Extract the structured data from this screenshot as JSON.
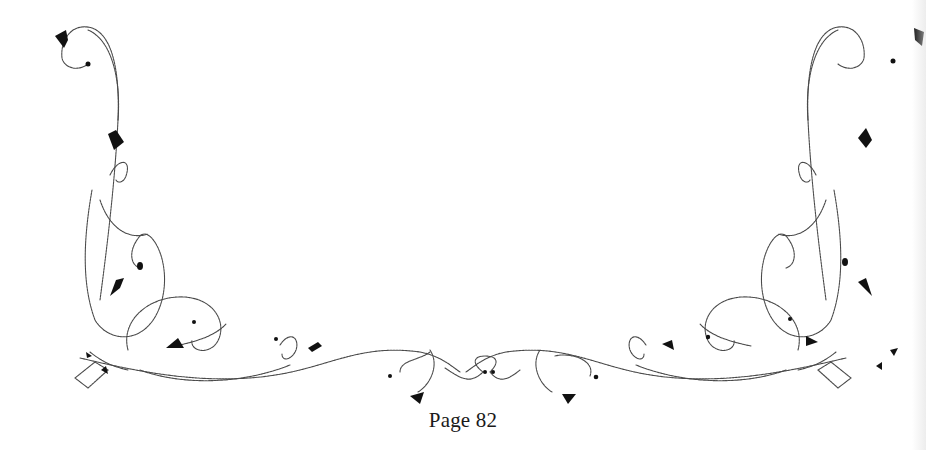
{
  "page": {
    "footer": {
      "page_number_label": "Page 82"
    },
    "ornament": {
      "type": "decorative-vine-border",
      "ink_color": "#111111",
      "stroke_color": "#4a4a4a",
      "background": "#ffffff"
    }
  }
}
